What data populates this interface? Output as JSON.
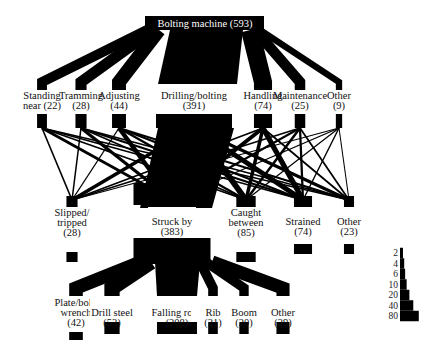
{
  "diagram": {
    "type": "flow-diagram",
    "ink_color": "#000000",
    "root": {
      "id": "bolting_machine",
      "label": "Bolting machine (593)",
      "name": "Bolting machine",
      "count": 593
    },
    "activities": [
      {
        "id": "standing_near",
        "lines": [
          "Standing",
          "near (22)"
        ],
        "name": "Standing near",
        "count": 22
      },
      {
        "id": "tramming",
        "lines": [
          "Tramming",
          "(28)"
        ],
        "name": "Tramming",
        "count": 28
      },
      {
        "id": "adjusting",
        "lines": [
          "Adjusting",
          "(44)"
        ],
        "name": "Adjusting",
        "count": 44
      },
      {
        "id": "drilling_bolting",
        "lines": [
          "Drilling/bolting",
          "(391)"
        ],
        "name": "Drilling/bolting",
        "count": 391
      },
      {
        "id": "handling",
        "lines": [
          "Handling",
          "(74)"
        ],
        "name": "Handling",
        "count": 74
      },
      {
        "id": "maintenance",
        "lines": [
          "Maintenance",
          "(25)"
        ],
        "name": "Maintenance",
        "count": 25
      },
      {
        "id": "other_activity",
        "lines": [
          "Other",
          "(9)"
        ],
        "name": "Other",
        "count": 9
      }
    ],
    "accident_types": [
      {
        "id": "slipped_tripped",
        "lines": [
          "Slipped/",
          "tripped",
          "(28)"
        ],
        "name": "Slipped/tripped",
        "count": 28
      },
      {
        "id": "struck_by",
        "lines": [
          "Struck by",
          "(383)"
        ],
        "name": "Struck by",
        "count": 383
      },
      {
        "id": "caught_between",
        "lines": [
          "Caught",
          "between",
          "(85)"
        ],
        "name": "Caught between",
        "count": 85
      },
      {
        "id": "strained",
        "lines": [
          "Strained",
          "(74)"
        ],
        "name": "Strained",
        "count": 74
      },
      {
        "id": "other_accident",
        "lines": [
          "Other",
          "(23)"
        ],
        "name": "Other",
        "count": 23
      }
    ],
    "struck_by_sources": [
      {
        "id": "plate_bolt_wrench",
        "lines": [
          "Plate/bolt/",
          "wrench",
          "(42)"
        ],
        "name": "Plate/bolt/wrench",
        "count": 42
      },
      {
        "id": "drill_steel",
        "lines": [
          "Drill steel",
          "(53)"
        ],
        "name": "Drill steel",
        "count": 53
      },
      {
        "id": "falling_rock",
        "lines": [
          "Falling rock",
          "(208)"
        ],
        "name": "Falling rock",
        "count": 208
      },
      {
        "id": "rib",
        "lines": [
          "Rib",
          "(21)"
        ],
        "name": "Rib",
        "count": 21
      },
      {
        "id": "boom",
        "lines": [
          "Boom",
          "(20)"
        ],
        "name": "Boom",
        "count": 20
      },
      {
        "id": "other_source",
        "lines": [
          "Other",
          "(39)"
        ],
        "name": "Other",
        "count": 39
      }
    ],
    "legend": {
      "title": "line width scale",
      "ticks": [
        "2",
        "4",
        "6",
        "10",
        "20",
        "40",
        "80"
      ]
    }
  }
}
